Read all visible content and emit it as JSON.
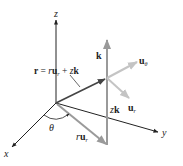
{
  "diagram": {
    "axes": {
      "x": "x",
      "y": "y",
      "z": "z"
    },
    "labels": {
      "position_vector": {
        "lhs": "r",
        "eq": " = ",
        "r": "r",
        "u": "u",
        "sub_r": "r",
        "plus": " + ",
        "z": "z",
        "k": "k"
      },
      "k_unit": "k",
      "u_theta": {
        "u": "u",
        "sub": "θ"
      },
      "u_r": {
        "u": "u",
        "sub": "r"
      },
      "z_k": {
        "z": "z",
        "k": "k"
      },
      "r_u_r": {
        "r": "r",
        "u": "u",
        "sub": "r"
      },
      "theta": "θ"
    },
    "colors": {
      "axis": "#222222",
      "position_vector": "#444444",
      "gray_vector": "#9a9a9a",
      "light_vector": "#c4c4c4",
      "background": "#ffffff"
    }
  }
}
